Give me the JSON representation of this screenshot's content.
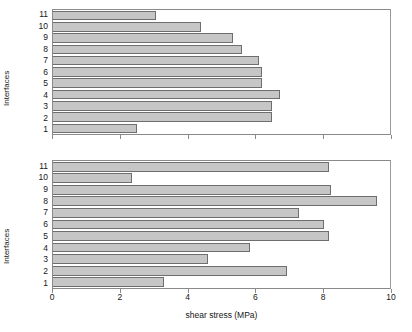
{
  "chart_data": [
    {
      "panel": "top",
      "type": "bar",
      "orientation": "horizontal",
      "title": "",
      "xlabel": "",
      "ylabel": "Interfaces",
      "xlim": [
        0,
        10
      ],
      "xticks": [
        0,
        2,
        4,
        6,
        8,
        10
      ],
      "xticklabels": [
        "",
        "",
        "",
        "",
        "",
        ""
      ],
      "grid": false,
      "legend": null,
      "categories": [
        "1",
        "2",
        "3",
        "4",
        "5",
        "6",
        "7",
        "8",
        "9",
        "10",
        "11"
      ],
      "values": [
        2.5,
        6.5,
        6.5,
        6.75,
        6.2,
        6.2,
        6.1,
        5.6,
        5.35,
        4.4,
        3.05
      ]
    },
    {
      "panel": "bottom",
      "type": "bar",
      "orientation": "horizontal",
      "title": "",
      "xlabel": "shear stress (MPa)",
      "ylabel": "Interfaces",
      "xlim": [
        0,
        10
      ],
      "xticks": [
        0,
        2,
        4,
        6,
        8,
        10
      ],
      "xticklabels": [
        "0",
        "2",
        "4",
        "6",
        "8",
        "10"
      ],
      "grid": false,
      "legend": null,
      "categories": [
        "1",
        "2",
        "3",
        "4",
        "5",
        "6",
        "7",
        "8",
        "9",
        "10",
        "11"
      ],
      "values": [
        3.3,
        6.95,
        4.6,
        5.85,
        8.2,
        8.05,
        7.3,
        9.6,
        8.25,
        2.35,
        8.2
      ]
    }
  ],
  "colors": {
    "bar_fill": "#c6c6c6",
    "bar_edge": "#6e6e6e",
    "frame": "#8a8a8a",
    "text": "#161616",
    "background": "#ffffff"
  }
}
